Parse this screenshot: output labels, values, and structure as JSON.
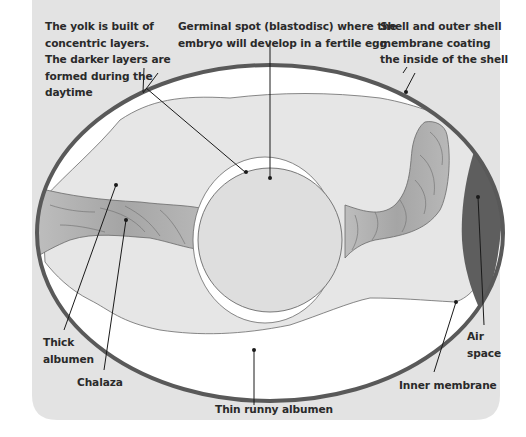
{
  "diagram": {
    "colors": {
      "background_panel": "#e3e3e3",
      "shell": "#595959",
      "thin_albumen": "#ffffff",
      "thick_albumen": "#e6e6e6",
      "yolk": "#dedede",
      "chalaza": "#a9a9a9",
      "air_space": "#5e5e5e",
      "text": "#2a2a2a"
    },
    "labels": {
      "yolk_layers": [
        "The yolk is built of",
        "concentric layers.",
        "The darker layers are",
        "formed during the",
        "daytime"
      ],
      "germinal_spot": [
        "Germinal spot (blastodisc) where the",
        "embryo will develop in a fertile egg"
      ],
      "shell": [
        "Shell and outer shell",
        "membrane coating",
        "the inside of the shell"
      ],
      "thick_albumen": [
        "Thick",
        "albumen"
      ],
      "chalaza": "Chalaza",
      "thin_albumen": "Thin runny albumen",
      "air_space": [
        "Air",
        "space"
      ],
      "inner_membrane": "Inner membrane"
    }
  }
}
